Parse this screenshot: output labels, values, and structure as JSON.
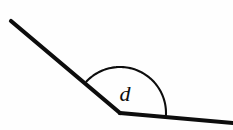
{
  "figure": {
    "type": "geometry-angle-diagram",
    "title": "",
    "background_color": "#fefefe",
    "stroke_color": "#0d0d0d",
    "canvas": {
      "width": 233,
      "height": 130
    }
  },
  "label": {
    "text": "d",
    "x": 125,
    "y": 93,
    "font_size": 22,
    "color": "#0d0d0d",
    "style": "italic-serif"
  },
  "vertex": {
    "x": 120,
    "y": 113
  },
  "rays": [
    {
      "name": "upper-left-ray",
      "from": {
        "x": 11,
        "y": 21
      },
      "to": {
        "x": 120,
        "y": 113
      },
      "stroke_width": 4.2
    },
    {
      "name": "lower-right-ray",
      "from": {
        "x": 120,
        "y": 113
      },
      "to": {
        "x": 233,
        "y": 123
      },
      "stroke_width": 4.2
    }
  ],
  "arc": {
    "name": "angle-arc",
    "radius": 46,
    "start": {
      "x": 89,
      "y": 84
    },
    "apex": {
      "x": 123,
      "y": 62
    },
    "end": {
      "x": 157,
      "y": 116
    },
    "stroke_width": 2.1,
    "sweep_description": "arc drawn from upper-left ray over the top to the lower-right ray, marking the reflex-side interior angle d"
  }
}
